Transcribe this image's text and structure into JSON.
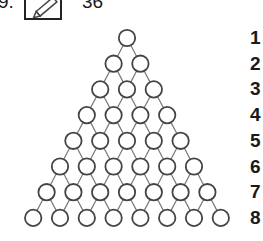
{
  "header": {
    "question_number": "9.",
    "icon": "pencil-icon",
    "score": "36"
  },
  "triangle": {
    "rows": 8,
    "row_labels": [
      "1",
      "2",
      "3",
      "4",
      "5",
      "6",
      "7",
      "8"
    ],
    "circle_stroke": "#444444",
    "line_color": "#777777"
  }
}
